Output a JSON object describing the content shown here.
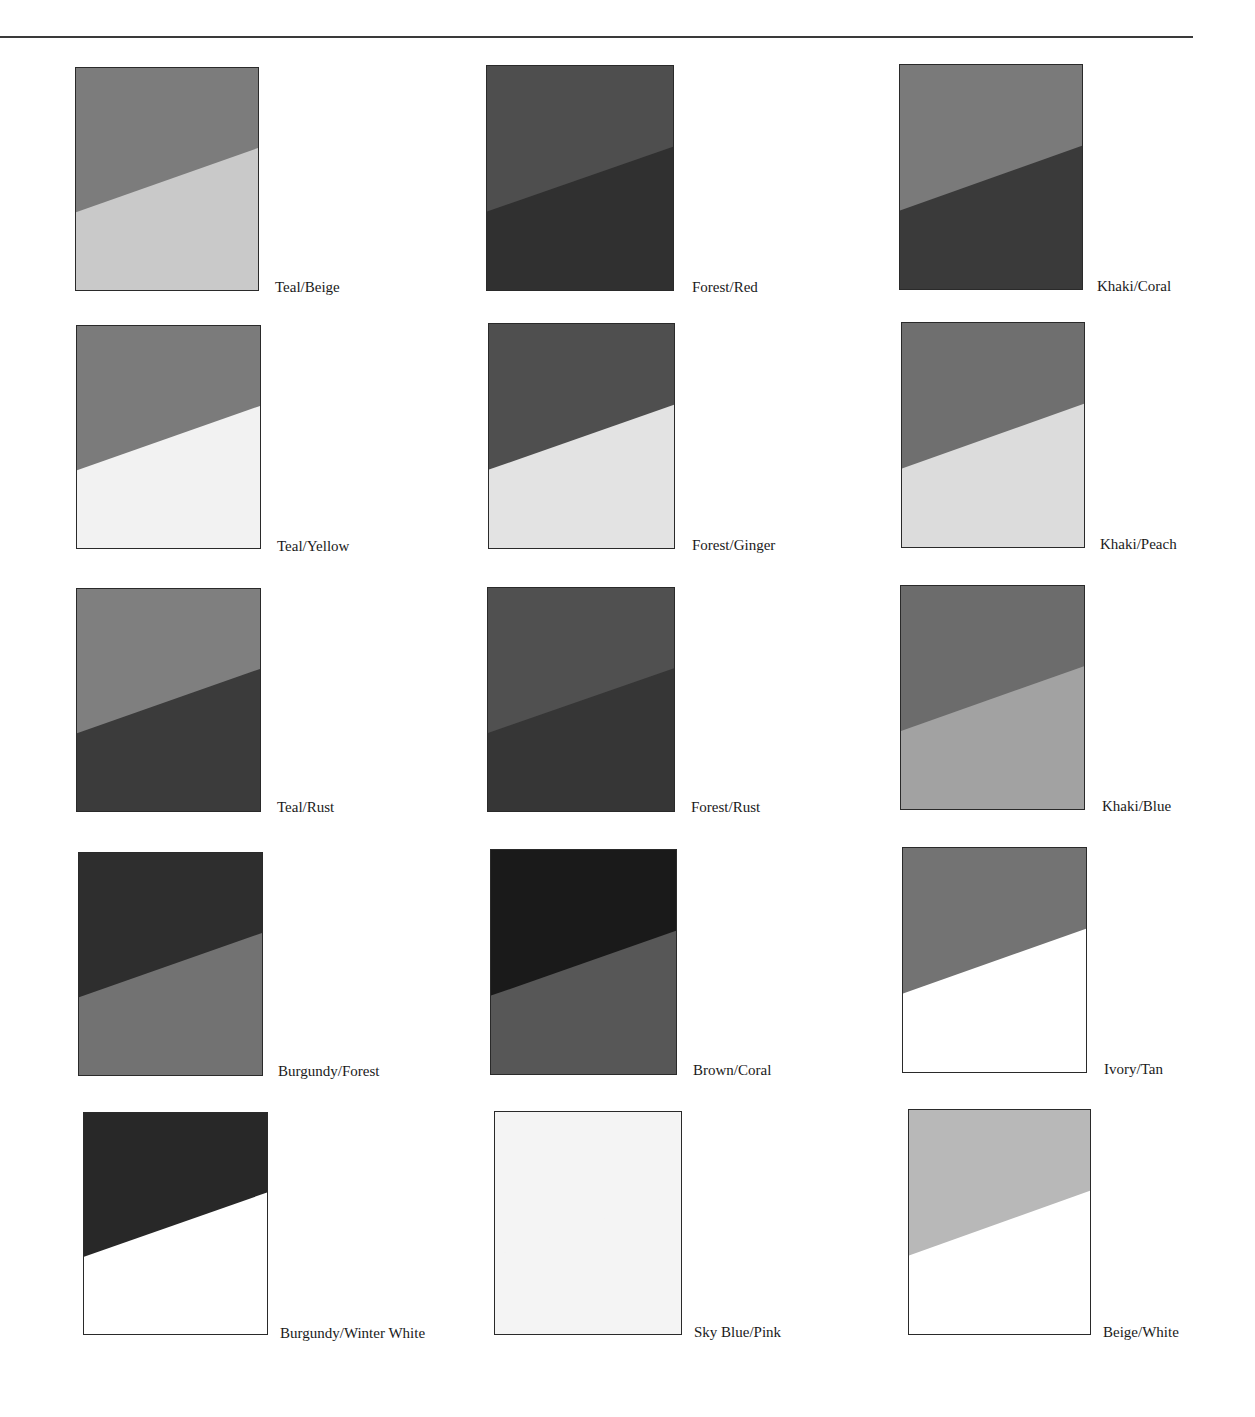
{
  "swatches": [
    {
      "label": "Teal/Beige",
      "top_color": "#7c7c7c",
      "bottom_color": "#c9c9c9",
      "box": [
        75,
        67,
        184,
        224
      ],
      "label_pos": [
        275,
        280
      ]
    },
    {
      "label": "Forest/Red",
      "top_color": "#4e4e4e",
      "bottom_color": "#303030",
      "box": [
        486,
        65,
        188,
        226
      ],
      "label_pos": [
        692,
        280
      ]
    },
    {
      "label": "Khaki/Coral",
      "top_color": "#7a7a7a",
      "bottom_color": "#3a3a3a",
      "box": [
        899,
        64,
        184,
        226
      ],
      "label_pos": [
        1097,
        279
      ]
    },
    {
      "label": "Teal/Yellow",
      "top_color": "#7b7b7b",
      "bottom_color": "#f2f2f2",
      "box": [
        76,
        325,
        185,
        224
      ],
      "label_pos": [
        277,
        539
      ]
    },
    {
      "label": "Forest/Ginger",
      "top_color": "#4f4f4f",
      "bottom_color": "#e3e3e3",
      "box": [
        488,
        323,
        187,
        226
      ],
      "label_pos": [
        692,
        538
      ]
    },
    {
      "label": "Khaki/Peach",
      "top_color": "#6f6f6f",
      "bottom_color": "#dcdcdc",
      "box": [
        901,
        322,
        184,
        226
      ],
      "label_pos": [
        1100,
        537
      ]
    },
    {
      "label": "Teal/Rust",
      "top_color": "#7f7f7f",
      "bottom_color": "#3b3b3b",
      "box": [
        76,
        588,
        185,
        224
      ],
      "label_pos": [
        277,
        800
      ]
    },
    {
      "label": "Forest/Rust",
      "top_color": "#505050",
      "bottom_color": "#363636",
      "box": [
        487,
        587,
        188,
        225
      ],
      "label_pos": [
        691,
        800
      ]
    },
    {
      "label": "Khaki/Blue",
      "top_color": "#6c6c6c",
      "bottom_color": "#a2a2a2",
      "box": [
        900,
        585,
        185,
        225
      ],
      "label_pos": [
        1102,
        799
      ]
    },
    {
      "label": "Burgundy/Forest",
      "top_color": "#2e2e2e",
      "bottom_color": "#727272",
      "box": [
        78,
        852,
        185,
        224
      ],
      "label_pos": [
        278,
        1064
      ]
    },
    {
      "label": "Brown/Coral",
      "top_color": "#1a1a1a",
      "bottom_color": "#575757",
      "box": [
        490,
        849,
        187,
        226
      ],
      "label_pos": [
        693,
        1063
      ]
    },
    {
      "label": "Ivory/Tan",
      "top_color": "#737373",
      "bottom_color": "#ffffff",
      "box": [
        902,
        847,
        185,
        226
      ],
      "label_pos": [
        1104,
        1062
      ]
    },
    {
      "label": "Burgundy/Winter White",
      "top_color": "#282828",
      "bottom_color": "#ffffff",
      "box": [
        83,
        1112,
        185,
        223
      ],
      "label_pos": [
        280,
        1326
      ]
    },
    {
      "label": "Sky Blue/Pink",
      "top_color": "#f4f4f4",
      "bottom_color": "#f4f4f4",
      "box": [
        494,
        1111,
        188,
        224
      ],
      "label_pos": [
        694,
        1325
      ]
    },
    {
      "label": "Beige/White",
      "top_color": "#b8b8b8",
      "bottom_color": "#ffffff",
      "box": [
        908,
        1109,
        183,
        226
      ],
      "label_pos": [
        1103,
        1325
      ]
    }
  ]
}
